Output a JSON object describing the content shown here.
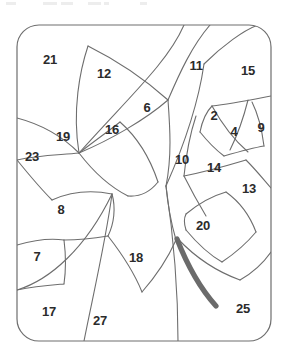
{
  "page": {
    "background_color": "#ffffff",
    "width": 288,
    "height": 359
  },
  "puzzle": {
    "type": "color-by-number-outline",
    "border_shape": "rounded-rectangle",
    "border_color": "#6e6e6e",
    "line_color": "#6e6e6e",
    "label_color": "#2b2b2b",
    "accent_stroke_color": "#6b6b6b",
    "region_count": 22,
    "regions": [
      {
        "number": "21",
        "x": 50,
        "y": 61
      },
      {
        "number": "12",
        "x": 104,
        "y": 75
      },
      {
        "number": "11",
        "x": 196,
        "y": 67
      },
      {
        "number": "15",
        "x": 248,
        "y": 72
      },
      {
        "number": "6",
        "x": 147,
        "y": 109
      },
      {
        "number": "2",
        "x": 214,
        "y": 117
      },
      {
        "number": "4",
        "x": 234,
        "y": 133
      },
      {
        "number": "9",
        "x": 261,
        "y": 129
      },
      {
        "number": "19",
        "x": 63,
        "y": 138
      },
      {
        "number": "16",
        "x": 112,
        "y": 131
      },
      {
        "number": "23",
        "x": 32,
        "y": 158
      },
      {
        "number": "10",
        "x": 182,
        "y": 161
      },
      {
        "number": "14",
        "x": 214,
        "y": 169
      },
      {
        "number": "13",
        "x": 249,
        "y": 190
      },
      {
        "number": "8",
        "x": 61,
        "y": 211
      },
      {
        "number": "20",
        "x": 203,
        "y": 227
      },
      {
        "number": "7",
        "x": 37,
        "y": 258
      },
      {
        "number": "18",
        "x": 136,
        "y": 259
      },
      {
        "number": "17",
        "x": 49,
        "y": 313
      },
      {
        "number": "27",
        "x": 100,
        "y": 322
      },
      {
        "number": "25",
        "x": 243,
        "y": 310
      }
    ],
    "cut_marks": [
      {
        "x": 6,
        "y": 2,
        "w": 10,
        "h": 3
      },
      {
        "x": 43,
        "y": 2,
        "w": 14,
        "h": 3
      },
      {
        "x": 61,
        "y": 2,
        "w": 12,
        "h": 3
      },
      {
        "x": 88,
        "y": 2,
        "w": 13,
        "h": 3
      },
      {
        "x": 104,
        "y": 2,
        "w": 5,
        "h": 3
      },
      {
        "x": 140,
        "y": 2,
        "w": 7,
        "h": 3
      }
    ]
  }
}
